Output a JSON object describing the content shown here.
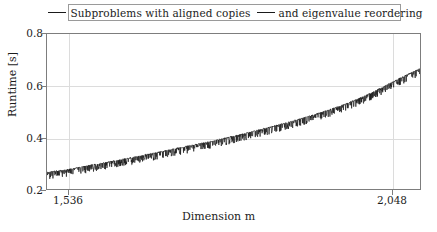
{
  "chart_data": {
    "type": "line",
    "title": "",
    "xlabel": "Dimension m",
    "ylabel": "Runtime [s]",
    "xlim": [
      1472,
      2112
    ],
    "ylim": [
      0.2,
      0.8
    ],
    "xticks": [
      1536,
      2048
    ],
    "xtick_labels": [
      "1,536",
      "2,048"
    ],
    "yticks": [
      0.2,
      0.4,
      0.6,
      0.8
    ],
    "ytick_labels": [
      "0.2",
      "0.4",
      "0.6",
      "0.8"
    ],
    "grid": true,
    "legend_position": "top-center",
    "series": [
      {
        "name": "Subproblems with aligned copies",
        "color": "#1a1a1a",
        "x": [
          1472,
          1486,
          1500,
          1514,
          1528,
          1542,
          1556,
          1570,
          1584,
          1598,
          1612,
          1626,
          1640,
          1654,
          1668,
          1682,
          1696,
          1710,
          1724,
          1738,
          1752,
          1766,
          1780,
          1794,
          1808,
          1822,
          1836,
          1850,
          1864,
          1878,
          1892,
          1906,
          1920,
          1934,
          1948,
          1962,
          1976,
          1990,
          2004,
          2018,
          2032,
          2046,
          2060,
          2074,
          2088,
          2102,
          2112
        ],
        "values": [
          0.263,
          0.268,
          0.272,
          0.277,
          0.283,
          0.289,
          0.295,
          0.3,
          0.306,
          0.312,
          0.318,
          0.324,
          0.331,
          0.337,
          0.343,
          0.35,
          0.357,
          0.363,
          0.369,
          0.376,
          0.383,
          0.39,
          0.397,
          0.404,
          0.412,
          0.42,
          0.428,
          0.436,
          0.444,
          0.452,
          0.461,
          0.47,
          0.479,
          0.489,
          0.499,
          0.51,
          0.521,
          0.533,
          0.546,
          0.56,
          0.575,
          0.591,
          0.607,
          0.623,
          0.639,
          0.654,
          0.665
        ]
      }
    ],
    "legend": [
      {
        "label": "Subproblems with aligned copies",
        "color": "#1a1a1a"
      },
      {
        "label": "and eigenvalue reordering",
        "color": "#1a1a1a"
      }
    ],
    "noise": {
      "description": "dense high-frequency downward spikes along the trend",
      "amplitude": 0.022
    }
  },
  "axes": {
    "y_label": "Runtime [s]",
    "x_label": "Dimension m",
    "y_ticks": [
      "0.2",
      "0.4",
      "0.6",
      "0.8"
    ],
    "x_ticks": [
      "1,536",
      "2,048"
    ]
  },
  "legend": {
    "entry0": "Subproblems with aligned copies",
    "entry1": "and eigenvalue reordering"
  }
}
